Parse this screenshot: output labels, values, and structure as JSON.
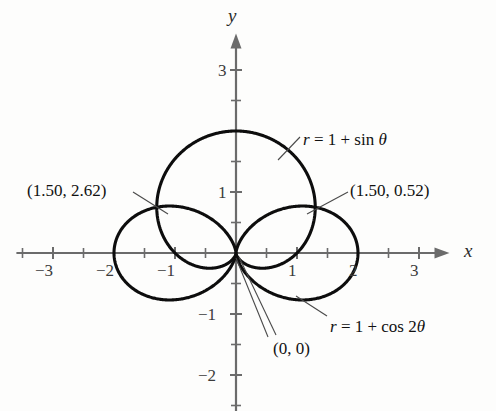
{
  "figure": {
    "kind": "polar-curve-plot",
    "background_color": "#fdfdfc",
    "curve_color": "#0d0d0d",
    "axis_color": "#6b6b6b"
  },
  "axes": {
    "x_label": "x",
    "y_label": "y",
    "x_ticks_major": [
      "-3",
      "-2",
      "-1",
      "1",
      "2",
      "3"
    ],
    "y_ticks_major": [
      "3",
      "1",
      "-1",
      "-2"
    ],
    "x_tick_values": [
      -3,
      -2,
      -1,
      1,
      2,
      3
    ],
    "y_tick_values": [
      3,
      1,
      -1,
      -2
    ],
    "x_minor_step": 0.5,
    "y_minor_step": 0.5,
    "x_range": [
      -3.6,
      3.5
    ],
    "y_range": [
      -2.6,
      3.6
    ],
    "origin_px": [
      236,
      253
    ],
    "scale_px_per_unit": 61
  },
  "curves": [
    {
      "id": "cardioid",
      "equation_label": "r = 1 + sin θ",
      "equation_parts": {
        "r": "r",
        "eq": " = 1 + ",
        "fn": "sin",
        "theta": "θ"
      },
      "type": "cardioid",
      "polar_form": "r = 1 + sin(theta)",
      "max_r": 2,
      "label_pos_px": [
        303,
        131
      ]
    },
    {
      "id": "rose",
      "equation_label": "r = 1 + cos 2θ",
      "equation_parts": {
        "r": "r",
        "eq": " = 1 + ",
        "fn": "cos",
        "arg": "2",
        "theta": "θ"
      },
      "type": "limacon-rose",
      "polar_form": "r = 1 + cos(2*theta)",
      "max_r": 2,
      "label_pos_px": [
        330,
        318
      ]
    }
  ],
  "annotations": [
    {
      "id": "intersection-left",
      "text": "(1.50, 2.62)",
      "polar_point": [
        1.5,
        2.62
      ],
      "label_pos_px": [
        27,
        182
      ],
      "target_px": [
        168,
        213
      ]
    },
    {
      "id": "intersection-right",
      "text": "(1.50, 0.52)",
      "polar_point": [
        1.5,
        0.52
      ],
      "label_pos_px": [
        350,
        182
      ],
      "target_px": [
        304,
        213
      ]
    },
    {
      "id": "origin-point",
      "text": "(0, 0)",
      "polar_point": [
        0,
        0
      ],
      "label_pos_px": [
        273,
        340
      ],
      "target_px": [
        237,
        255
      ]
    }
  ],
  "chart_data": {
    "type": "line",
    "title": "",
    "xlabel": "x",
    "ylabel": "y",
    "xlim": [
      -3.6,
      3.5
    ],
    "ylim": [
      -2.6,
      3.6
    ],
    "grid": false,
    "legend": "none",
    "coordinate_system": "polar-rendered-on-cartesian",
    "series": [
      {
        "name": "r = 1 + sin θ",
        "polar_equation": "r = 1 + sin(theta)",
        "theta_range_deg": [
          0,
          360
        ],
        "key_points_polar": [
          {
            "theta_deg": 0,
            "r": 1
          },
          {
            "theta_deg": 90,
            "r": 2
          },
          {
            "theta_deg": 180,
            "r": 1
          },
          {
            "theta_deg": 270,
            "r": 0
          }
        ],
        "key_points_cartesian": [
          {
            "x": 1,
            "y": 0
          },
          {
            "x": 0,
            "y": 2
          },
          {
            "x": -1,
            "y": 0
          },
          {
            "x": 0,
            "y": 0
          }
        ]
      },
      {
        "name": "r = 1 + cos 2θ",
        "polar_equation": "r = 1 + cos(2*theta)",
        "theta_range_deg": [
          0,
          360
        ],
        "key_points_polar": [
          {
            "theta_deg": 0,
            "r": 2
          },
          {
            "theta_deg": 90,
            "r": 0
          },
          {
            "theta_deg": 180,
            "r": 2
          },
          {
            "theta_deg": 270,
            "r": 0
          }
        ],
        "key_points_cartesian": [
          {
            "x": 2,
            "y": 0
          },
          {
            "x": 0,
            "y": 0
          },
          {
            "x": -2,
            "y": 0
          },
          {
            "x": 0,
            "y": 0
          }
        ]
      }
    ],
    "intersections_polar": [
      {
        "r": 1.5,
        "theta_rad": 2.62
      },
      {
        "r": 1.5,
        "theta_rad": 0.52
      },
      {
        "r": 0,
        "theta_rad": 0
      }
    ]
  }
}
